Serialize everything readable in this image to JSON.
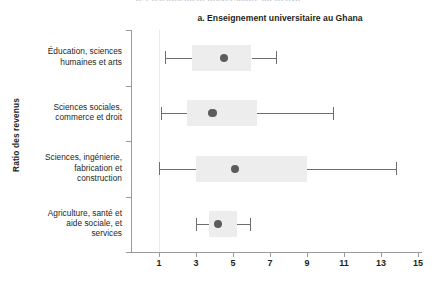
{
  "figure": {
    "panel_label": "a.",
    "title": "a. Enseignement universitaire au Ghana",
    "bleed_text": "b. Enseignement universitaire au Kenya",
    "ylabel": "Ratio des revenus"
  },
  "chart_data": {
    "type": "boxplot",
    "title": "a. Enseignement universitaire au Ghana",
    "xlabel": "",
    "ylabel": "Ratio des revenus",
    "orientation": "horizontal",
    "grid": false,
    "reference_line": 1,
    "xlim": [
      0.2,
      15.5
    ],
    "xticks": [
      1,
      3,
      5,
      7,
      9,
      11,
      13,
      15
    ],
    "xticklabels": [
      "1",
      "3",
      "5",
      "7",
      "9",
      "11",
      "13",
      "15"
    ],
    "categories": [
      "Éducation, sciences humaines et arts",
      "Sciences sociales, commerce et droit",
      "Sciences, ingénierie, fabrication et construction",
      "Agriculture, santé et aide sociale, et services"
    ],
    "category_lines": [
      [
        "Éducation, sciences",
        "humaines et arts"
      ],
      [
        "Sciences sociales,",
        "commerce et droit"
      ],
      [
        "Sciences, ingénierie,",
        "fabrication et",
        "construction"
      ],
      [
        "Agriculture, santé et",
        "aide sociale, et",
        "services"
      ]
    ],
    "series": [
      {
        "name": "Éducation, sciences humaines et arts",
        "whisker_low": 1.3,
        "q1": 2.8,
        "median": 4.5,
        "q3": 6.0,
        "whisker_high": 7.3
      },
      {
        "name": "Sciences sociales, commerce et droit",
        "whisker_low": 1.1,
        "q1": 2.5,
        "median": 3.9,
        "q3": 6.3,
        "whisker_high": 10.4
      },
      {
        "name": "Sciences, ingénierie, fabrication et construction",
        "whisker_low": 1.0,
        "q1": 3.0,
        "median": 5.1,
        "q3": 9.0,
        "whisker_high": 13.8
      },
      {
        "name": "Agriculture, santé et aide sociale, et services",
        "whisker_low": 3.0,
        "q1": 3.7,
        "median": 4.2,
        "q3": 5.2,
        "whisker_high": 5.9
      }
    ],
    "colors": {
      "box_fill": "#ededed",
      "whisker": "#6d6d6d",
      "median_dot": "#5c5c5c",
      "axis": "#9a9a9a",
      "text": "#231f20",
      "reference_line": "#ebebef"
    }
  }
}
